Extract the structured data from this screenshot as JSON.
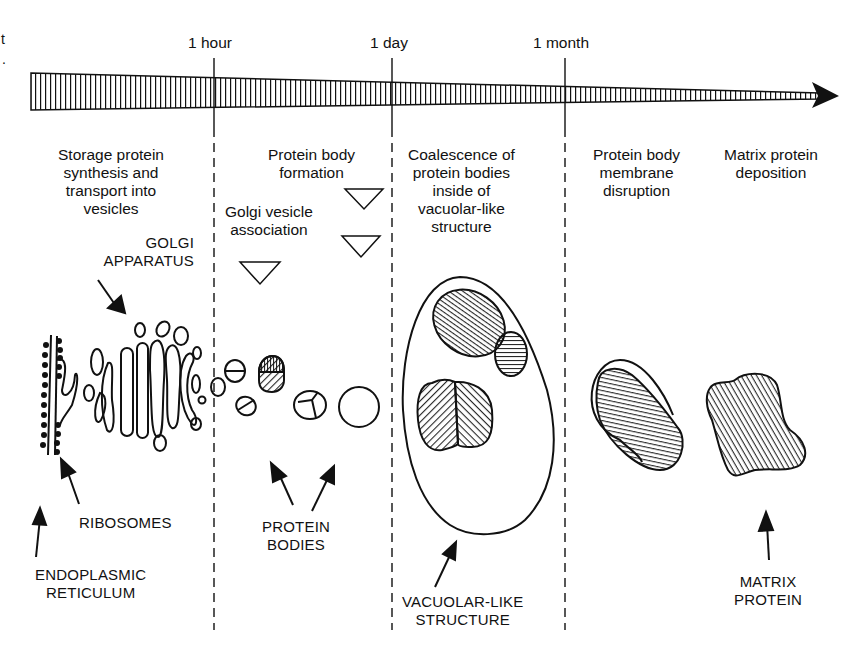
{
  "figure": {
    "stray_marks": [
      "t",
      "."
    ],
    "timeline": {
      "ticks": [
        {
          "label": "1 hour",
          "x": 214
        },
        {
          "label": "1 day",
          "x": 392
        },
        {
          "label": "1 month",
          "x": 565
        }
      ],
      "arrow_direction": "right"
    },
    "stages": [
      {
        "id": "synthesis",
        "lines": [
          "Storage protein",
          "synthesis and",
          "transport into",
          "vesicles"
        ]
      },
      {
        "id": "pb-formation",
        "lines": [
          "Protein body",
          "formation"
        ]
      },
      {
        "id": "golgi-assoc",
        "lines": [
          "Golgi vesicle",
          "association"
        ]
      },
      {
        "id": "coalescence",
        "lines": [
          "Coalescence of",
          "protein bodies",
          "inside of",
          "vacuolar-like",
          "structure"
        ]
      },
      {
        "id": "membrane-disruption",
        "lines": [
          "Protein body",
          "membrane",
          "disruption"
        ]
      },
      {
        "id": "matrix-deposition",
        "lines": [
          "Matrix protein",
          "deposition"
        ]
      }
    ],
    "structure_labels": [
      {
        "id": "golgi",
        "lines": [
          "GOLGI",
          "APPARATUS"
        ]
      },
      {
        "id": "ribosomes",
        "lines": [
          "RIBOSOMES"
        ]
      },
      {
        "id": "er",
        "lines": [
          "ENDOPLASMIC",
          "RETICULUM"
        ]
      },
      {
        "id": "protein-bodies",
        "lines": [
          "PROTEIN",
          "BODIES"
        ]
      },
      {
        "id": "vacuolar",
        "lines": [
          "VACUOLAR-LIKE",
          "STRUCTURE"
        ]
      },
      {
        "id": "matrix",
        "lines": [
          "MATRIX",
          "PROTEIN"
        ]
      }
    ],
    "colors": {
      "ink": "#111111",
      "background": "#ffffff"
    }
  }
}
